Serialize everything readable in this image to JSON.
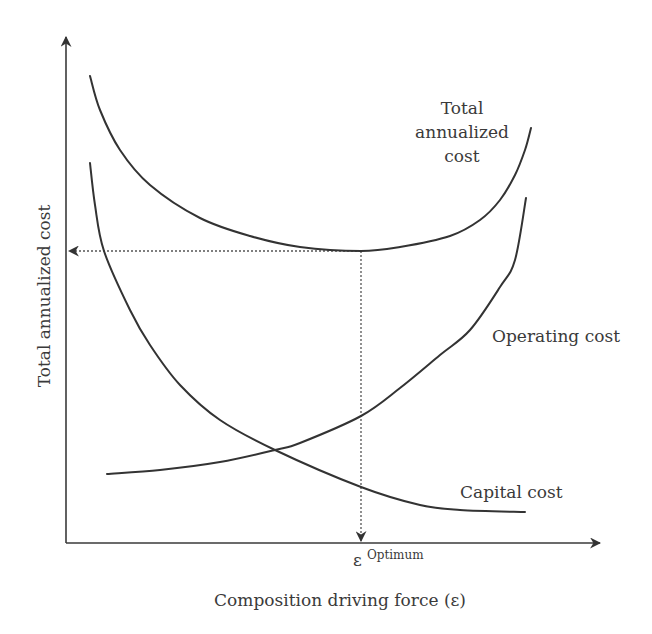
{
  "chart_data": {
    "type": "line",
    "title": "",
    "xlabel": "Composition driving force (ε)",
    "ylabel": "Total annualized cost",
    "grid": false,
    "legend": "inline curve labels",
    "x_tick_labels": [
      {
        "label": "ε",
        "superscript": "Optimum",
        "x_px": 361
      }
    ],
    "series": [
      {
        "name": "Total annualized cost",
        "label_lines": [
          "Total",
          "annualized",
          "cost"
        ],
        "points_px": [
          [
            90,
            76
          ],
          [
            100,
            110
          ],
          [
            120,
            150
          ],
          [
            150,
            185
          ],
          [
            200,
            218
          ],
          [
            250,
            236
          ],
          [
            300,
            247
          ],
          [
            361,
            251
          ],
          [
            400,
            247
          ],
          [
            450,
            236
          ],
          [
            480,
            220
          ],
          [
            500,
            200
          ],
          [
            515,
            175
          ],
          [
            525,
            150
          ],
          [
            531,
            128
          ]
        ]
      },
      {
        "name": "Operating cost",
        "points_px": [
          [
            107,
            474
          ],
          [
            160,
            470
          ],
          [
            220,
            462
          ],
          [
            275,
            450
          ],
          [
            300,
            443
          ],
          [
            361,
            416
          ],
          [
            400,
            388
          ],
          [
            440,
            355
          ],
          [
            470,
            330
          ],
          [
            500,
            287
          ],
          [
            515,
            260
          ],
          [
            526,
            198
          ]
        ]
      },
      {
        "name": "Capital cost",
        "points_px": [
          [
            90,
            163
          ],
          [
            95,
            205
          ],
          [
            104,
            251
          ],
          [
            130,
            310
          ],
          [
            150,
            345
          ],
          [
            180,
            385
          ],
          [
            220,
            420
          ],
          [
            275,
            450
          ],
          [
            361,
            487
          ],
          [
            420,
            505
          ],
          [
            460,
            510
          ],
          [
            525,
            512
          ]
        ]
      }
    ],
    "annotations": [
      {
        "type": "dotted-horizontal",
        "from_px": [
          361,
          251
        ],
        "to_px": [
          66,
          251
        ],
        "arrow": "at y-axis",
        "meaning": "minimum total annualized cost"
      },
      {
        "type": "dotted-vertical",
        "from_px": [
          361,
          251
        ],
        "to_px": [
          361,
          543
        ],
        "arrow": "at x-axis",
        "meaning": "optimum driving force"
      }
    ],
    "axes_px": {
      "origin": [
        66,
        543
      ],
      "x_end": 602,
      "y_end": 35
    }
  },
  "labels": {
    "total_line1": "Total",
    "total_line2": "annualized",
    "total_line3": "cost",
    "operating": "Operating cost",
    "capital": "Capital cost",
    "x_tick_base": "ε",
    "x_tick_sup": "Optimum",
    "xlabel": "Composition driving force (ε)",
    "ylabel": "Total annualized cost"
  }
}
